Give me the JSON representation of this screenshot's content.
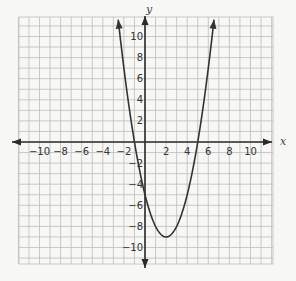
{
  "chart_data": {
    "type": "line",
    "title": "",
    "xlabel": "x",
    "ylabel": "y",
    "xlim": [
      -12,
      12
    ],
    "ylim": [
      -12,
      12
    ],
    "grid": true,
    "x_ticks": [
      -10,
      -8,
      -6,
      -4,
      -2,
      2,
      4,
      6,
      8,
      10
    ],
    "y_ticks": [
      10,
      8,
      6,
      4,
      2,
      -2,
      -4,
      -6,
      -8,
      -10
    ],
    "x_tick_labels": [
      "−10",
      "−8",
      "−6",
      "−4",
      "−2",
      "2",
      "4",
      "6",
      "8",
      "10"
    ],
    "y_tick_labels": [
      "10",
      "8",
      "6",
      "4",
      "2",
      "−2",
      "−4",
      "−6",
      "−8",
      "−10"
    ],
    "series": [
      {
        "name": "parabola",
        "equation": "y = (x - 2)^2 - 9",
        "vertex": [
          2,
          -9
        ],
        "x_intercepts": [
          -1,
          5
        ],
        "y_intercept": -5,
        "x": [
          -1.5,
          -1,
          0,
          1,
          2,
          3,
          4,
          5,
          6
        ],
        "y": [
          3.25,
          0,
          -5,
          -8,
          -9,
          -8,
          -5,
          0,
          7
        ],
        "arrows_at_ends": true,
        "color": "#333333"
      }
    ],
    "legend": null
  },
  "style": {
    "grid_color": "#bdbdbd",
    "axis_color": "#2b2b2b",
    "curve_color": "#333333",
    "background": "#f7f7f5"
  }
}
